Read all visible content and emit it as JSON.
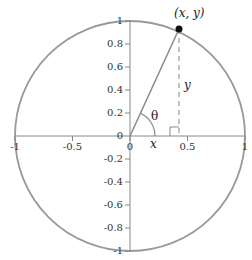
{
  "diagram": {
    "colors": {
      "circle": "#999999",
      "axes": "#888888",
      "radius_line": "#888888",
      "dashed_line": "#999999",
      "point": "#111111",
      "text": "#333333"
    },
    "x_ticks": [
      {
        "value": -1,
        "label": "-1"
      },
      {
        "value": -0.5,
        "label": "-0.5"
      },
      {
        "value": 0,
        "label": "0"
      },
      {
        "value": 0.5,
        "label": "0.5"
      },
      {
        "value": 1,
        "label": "1"
      }
    ],
    "y_ticks": [
      {
        "value": 1,
        "label": "1"
      },
      {
        "value": 0.8,
        "label": "0.8"
      },
      {
        "value": 0.6,
        "label": "0.6"
      },
      {
        "value": 0.4,
        "label": "0.4"
      },
      {
        "value": 0.2,
        "label": "0.2"
      },
      {
        "value": 0,
        "label": "0"
      },
      {
        "value": -0.2,
        "label": "-0.2"
      },
      {
        "value": -0.4,
        "label": "-0.4"
      },
      {
        "value": -0.6,
        "label": "-0.6"
      },
      {
        "value": -0.8,
        "label": "-0.8"
      },
      {
        "value": -1,
        "label": "-1"
      }
    ],
    "point": {
      "x": 0.43,
      "y": 0.9,
      "label": "(x, y)"
    },
    "labels": {
      "x_segment": "x",
      "y_segment": "y",
      "angle": "θ"
    }
  }
}
